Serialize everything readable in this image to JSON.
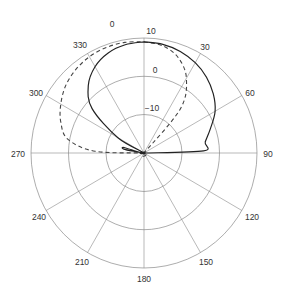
{
  "chart_data": {
    "type": "polar",
    "title": "",
    "angular_unit": "degrees",
    "angular_direction": "clockwise",
    "zero_location": "top",
    "angular_ticks": [
      0,
      30,
      60,
      90,
      120,
      150,
      180,
      210,
      240,
      270,
      300,
      330
    ],
    "angular_tick_labels": [
      "0",
      "30",
      "60",
      "90",
      "120",
      "150",
      "180",
      "210",
      "240",
      "270",
      "300",
      "330"
    ],
    "radial_unit": "dB",
    "radial_range": [
      -20,
      10
    ],
    "radial_ticks": [
      -10,
      0,
      10
    ],
    "radial_tick_labels": [
      "-10",
      "0",
      "10"
    ],
    "grid": true,
    "legend": null,
    "series": [
      {
        "name": "solid",
        "style": "solid",
        "color": "#222222",
        "points": [
          {
            "angle": 0,
            "value": 9.0
          },
          {
            "angle": 10,
            "value": 8.8
          },
          {
            "angle": 20,
            "value": 8.2
          },
          {
            "angle": 30,
            "value": 7.2
          },
          {
            "angle": 40,
            "value": 5.8
          },
          {
            "angle": 50,
            "value": 4.0
          },
          {
            "angle": 60,
            "value": 1.8
          },
          {
            "angle": 70,
            "value": -1.2
          },
          {
            "angle": 80,
            "value": -3.5
          },
          {
            "angle": 88,
            "value": -4.2
          },
          {
            "angle": 90,
            "value": -20
          },
          {
            "angle": 270,
            "value": -20
          },
          {
            "angle": 280,
            "value": -15
          },
          {
            "angle": 285,
            "value": -14.5
          },
          {
            "angle": 290,
            "value": -20
          },
          {
            "angle": 300,
            "value": -12
          },
          {
            "angle": 310,
            "value": -2.0
          },
          {
            "angle": 320,
            "value": 3.0
          },
          {
            "angle": 330,
            "value": 6.0
          },
          {
            "angle": 340,
            "value": 7.8
          },
          {
            "angle": 350,
            "value": 8.7
          },
          {
            "angle": 360,
            "value": 9.0
          }
        ]
      },
      {
        "name": "dashed",
        "style": "dashed",
        "color": "#444444",
        "points": [
          {
            "angle": 0,
            "value": 9.0
          },
          {
            "angle": 10,
            "value": 8.4
          },
          {
            "angle": 20,
            "value": 6.5
          },
          {
            "angle": 30,
            "value": 2.5
          },
          {
            "angle": 40,
            "value": -5.0
          },
          {
            "angle": 45,
            "value": -20
          },
          {
            "angle": 270,
            "value": -20
          },
          {
            "angle": 272,
            "value": -7.0
          },
          {
            "angle": 280,
            "value": 0.5
          },
          {
            "angle": 290,
            "value": 3.5
          },
          {
            "angle": 300,
            "value": 5.5
          },
          {
            "angle": 310,
            "value": 7.2
          },
          {
            "angle": 320,
            "value": 8.3
          },
          {
            "angle": 330,
            "value": 9.0
          },
          {
            "angle": 340,
            "value": 9.3
          },
          {
            "angle": 350,
            "value": 9.3
          },
          {
            "angle": 360,
            "value": 9.0
          }
        ]
      }
    ]
  },
  "labels": {
    "angles": {
      "a0": "0",
      "a30": "30",
      "a60": "60",
      "a90": "90",
      "a120": "120",
      "a150": "150",
      "a180": "180",
      "a210": "210",
      "a240": "240",
      "a270": "270",
      "a300": "300",
      "a330": "330"
    },
    "radial": {
      "r10": "10",
      "r0": "0",
      "rm10": "−10"
    }
  }
}
